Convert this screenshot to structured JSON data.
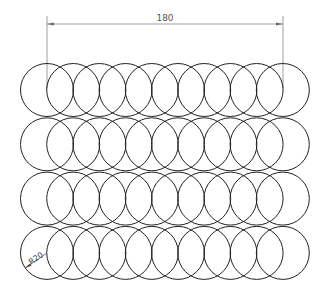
{
  "drawing": {
    "dimension_label": "180",
    "radius_label": "R20",
    "rows": 4,
    "columns": 10,
    "line_color": "#222222",
    "dimension_color": "#666666"
  }
}
